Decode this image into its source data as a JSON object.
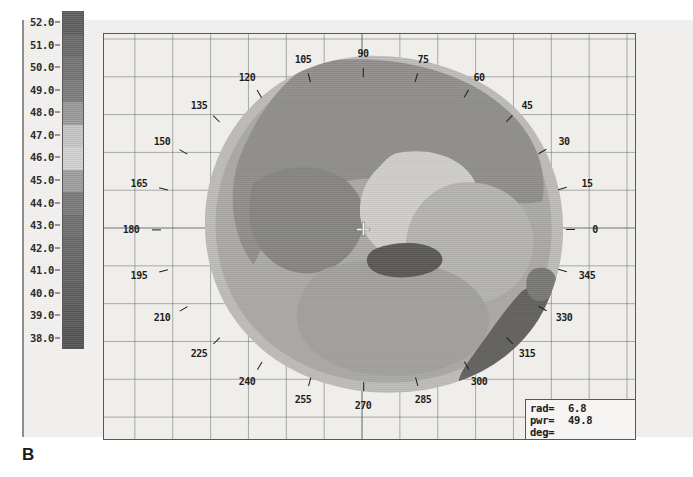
{
  "panel": {
    "letter": "B"
  },
  "scale": {
    "name": "dioptre-colour-scale",
    "unit": "D",
    "labels": [
      "52.0",
      "51.0",
      "50.0",
      "49.0",
      "48.0",
      "47.0",
      "46.0",
      "45.0",
      "44.0",
      "43.0",
      "42.0",
      "41.0",
      "40.0",
      "39.0",
      "38.0"
    ],
    "values": [
      52.0,
      51.0,
      50.0,
      49.0,
      48.0,
      47.0,
      46.0,
      45.0,
      44.0,
      43.0,
      42.0,
      41.0,
      40.0,
      39.0,
      38.0
    ],
    "min": 38.0,
    "max": 52.0,
    "colors": [
      "#5e5e5e",
      "#6a6a6a",
      "#747474",
      "#7c7c7c",
      "#9a9a9a",
      "#c6c6c6",
      "#d2d2d2",
      "#9e9e9e",
      "#7a7a7a",
      "#6e6e6e",
      "#686868",
      "#636363",
      "#5d5d5d",
      "#585858",
      "#535353"
    ]
  },
  "map": {
    "name": "corneal-topography-map",
    "title": "Axial curvature map",
    "centre_label": "map-centre-crosshair",
    "meridians": [
      {
        "deg": 0,
        "label": "0"
      },
      {
        "deg": 15,
        "label": "15"
      },
      {
        "deg": 30,
        "label": "30"
      },
      {
        "deg": 45,
        "label": "45"
      },
      {
        "deg": 60,
        "label": "60"
      },
      {
        "deg": 75,
        "label": "75"
      },
      {
        "deg": 90,
        "label": "90"
      },
      {
        "deg": 105,
        "label": "105"
      },
      {
        "deg": 120,
        "label": "120"
      },
      {
        "deg": 135,
        "label": "135"
      },
      {
        "deg": 150,
        "label": "150"
      },
      {
        "deg": 165,
        "label": "165"
      },
      {
        "deg": 180,
        "label": "180"
      },
      {
        "deg": 195,
        "label": "195"
      },
      {
        "deg": 210,
        "label": "210"
      },
      {
        "deg": 225,
        "label": "225"
      },
      {
        "deg": 240,
        "label": "240"
      },
      {
        "deg": 255,
        "label": "255"
      },
      {
        "deg": 270,
        "label": "270"
      },
      {
        "deg": 285,
        "label": "285"
      },
      {
        "deg": 300,
        "label": "300"
      },
      {
        "deg": 315,
        "label": "315"
      },
      {
        "deg": 330,
        "label": "330"
      },
      {
        "deg": 345,
        "label": "345"
      }
    ],
    "grid": true
  },
  "readout": {
    "name": "measurement-readout",
    "rows": [
      {
        "label": "rad=",
        "value": "6.8"
      },
      {
        "label": "pwr=",
        "value": "49.8"
      },
      {
        "label": "deg=",
        "value": ""
      }
    ]
  },
  "chart_data": {
    "type": "heatmap",
    "xlabel": "",
    "ylabel": "",
    "colorbar_label": "Dioptres (D)",
    "colorbar_ticks": [
      38.0,
      39.0,
      40.0,
      41.0,
      42.0,
      43.0,
      44.0,
      45.0,
      46.0,
      47.0,
      48.0,
      49.0,
      50.0,
      51.0,
      52.0
    ],
    "zlim": [
      38.0,
      52.0
    ],
    "angular_ticks": [
      0,
      15,
      30,
      45,
      60,
      75,
      90,
      105,
      120,
      135,
      150,
      165,
      180,
      195,
      210,
      225,
      240,
      255,
      270,
      285,
      300,
      315,
      330,
      345
    ],
    "grid": true,
    "legend_position": "left",
    "annotations": [
      {
        "text": "rad= 6.8",
        "kind": "readout"
      },
      {
        "text": "pwr= 49.8",
        "kind": "readout"
      },
      {
        "text": "deg=",
        "kind": "readout"
      }
    ],
    "regions": [
      {
        "name": "outer-cornea",
        "approx_power": 41.5,
        "color": "#b9b9b9"
      },
      {
        "name": "mid-peripheral-ring",
        "approx_power": 43.5,
        "color": "#a4a4a4"
      },
      {
        "name": "superior-steep-zone",
        "approx_power": 45.5,
        "color": "#8f8f8f"
      },
      {
        "name": "central-flat-island",
        "approx_power": 47.5,
        "color": "#c8c8c8"
      },
      {
        "name": "paracentral-steep",
        "approx_power": 46.0,
        "color": "#9b9b9b"
      },
      {
        "name": "apex-hot-spot",
        "approx_power": 49.8,
        "color": "#5a5a5a"
      },
      {
        "name": "inferotemporal-steep-wedge",
        "approx_power": 51.0,
        "color": "#616161"
      }
    ]
  }
}
